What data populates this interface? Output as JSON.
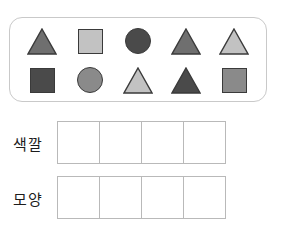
{
  "worksheet": {
    "shape_panel": {
      "name": "shape-collection",
      "rows": [
        [
          {
            "shape": "triangle",
            "color": "#6f6f6f",
            "label": "gray-triangle"
          },
          {
            "shape": "square",
            "color": "#c2c2c2",
            "label": "light-gray-square"
          },
          {
            "shape": "circle",
            "color": "#4a4a4a",
            "label": "dark-gray-circle"
          },
          {
            "shape": "triangle",
            "color": "#6f6f6f",
            "label": "gray-triangle"
          },
          {
            "shape": "triangle",
            "color": "#c2c2c2",
            "label": "light-gray-triangle"
          }
        ],
        [
          {
            "shape": "square",
            "color": "#4a4a4a",
            "label": "dark-gray-square"
          },
          {
            "shape": "circle",
            "color": "#8a8a8a",
            "label": "gray-circle"
          },
          {
            "shape": "triangle",
            "color": "#c2c2c2",
            "label": "light-gray-triangle"
          },
          {
            "shape": "triangle",
            "color": "#4a4a4a",
            "label": "dark-gray-triangle"
          },
          {
            "shape": "square",
            "color": "#8a8a8a",
            "label": "gray-square"
          }
        ]
      ]
    },
    "answer_rows": [
      {
        "label": "색깔",
        "key": "color",
        "cells": [
          "",
          "",
          "",
          ""
        ]
      },
      {
        "label": "모양",
        "key": "shape",
        "cells": [
          "",
          "",
          "",
          ""
        ]
      }
    ],
    "colors": {
      "panel_border": "#c9c9c9",
      "cell_border": "#b9b9b9",
      "shape_outline": "#3a3a3a",
      "text": "#1c1c1c",
      "background": "#ffffff"
    }
  }
}
